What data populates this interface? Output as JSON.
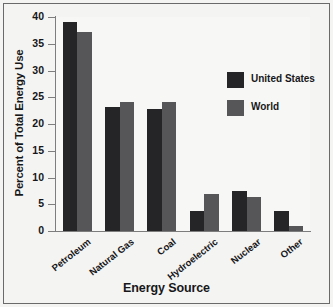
{
  "chart_data": {
    "type": "bar",
    "title": "",
    "xlabel": "Energy Source",
    "ylabel": "Percent of Total Energy Use",
    "categories": [
      "Petroleum",
      "Natural Gas",
      "Coal",
      "Hydroelectric",
      "Nuclear",
      "Other"
    ],
    "series": [
      {
        "name": "United States",
        "color": "#252527",
        "values": [
          39.0,
          23.2,
          22.9,
          3.8,
          7.5,
          3.8
        ]
      },
      {
        "name": "World",
        "color": "#565658",
        "values": [
          37.2,
          24.2,
          24.2,
          6.9,
          6.3,
          1.0
        ]
      }
    ],
    "ylim": [
      0,
      40
    ],
    "yticks": [
      0,
      5,
      10,
      15,
      20,
      25,
      30,
      35,
      40
    ],
    "ytick_labels": [
      "0",
      "5",
      "10",
      "15",
      "20",
      "25",
      "30",
      "35",
      "40"
    ],
    "grid": false,
    "legend_position": "upper right"
  },
  "figure": {
    "background_color": "#f4f4f2",
    "frame_color": "#6a6a6a",
    "axis_color": "#7d7d7d"
  }
}
